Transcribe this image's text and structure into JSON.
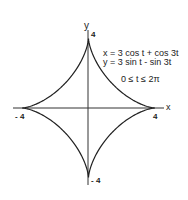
{
  "chart_data": {
    "type": "line",
    "title": "",
    "curve": "astroid-like hypocycloid (4 cusps)",
    "equations": {
      "x": "x = 3 cos t + cos 3t",
      "y": "y = 3 sin t - sin 3t",
      "domain": "0 ≤ t ≤ 2π"
    },
    "xlabel": "x",
    "ylabel": "y",
    "xlim": [
      -4,
      4
    ],
    "ylim": [
      -4,
      4
    ],
    "ticks": {
      "x": [
        "-4",
        "4"
      ],
      "y": [
        "4",
        "-4"
      ]
    },
    "cusps": [
      [
        4,
        0
      ],
      [
        0,
        4
      ],
      [
        -4,
        0
      ],
      [
        0,
        -4
      ]
    ],
    "grid": false,
    "legend": "none"
  },
  "axes": {
    "x_label": "x",
    "y_label": "y",
    "x_neg_tick": "- 4",
    "x_pos_tick": "4",
    "y_pos_tick": "4",
    "y_neg_tick": "- 4"
  },
  "annotation": {
    "line1": "x = 3 cos t + cos 3t",
    "line2": "y = 3 sin t - sin 3t",
    "line3": "0 ≤ t ≤ 2π"
  },
  "colors": {
    "curve": "#222222",
    "axes": "#333333"
  }
}
